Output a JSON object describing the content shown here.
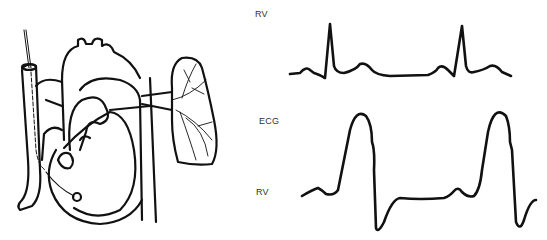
{
  "figure": {
    "labels": [
      {
        "text": "RV",
        "x": 255,
        "y": 9
      },
      {
        "text": "ECG",
        "x": 259,
        "y": 116
      },
      {
        "text": "RV",
        "x": 256,
        "y": 187
      }
    ],
    "stroke_color": "#111111",
    "background": "#ffffff"
  }
}
